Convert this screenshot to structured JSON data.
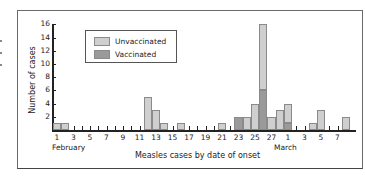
{
  "chart_data": {
    "type": "bar",
    "stacked": true,
    "title": "",
    "xlabel": "Measles cases by date of onset",
    "ylabel": "Number of cases",
    "ylim": [
      0,
      16
    ],
    "yticks": [
      2,
      4,
      6,
      8,
      10,
      12,
      14,
      16
    ],
    "grid": false,
    "legend_position": "upper-left-inside",
    "colors": {
      "Unvaccinated": "#cfcfcf",
      "Vaccinated": "#9a9a9a"
    },
    "xtick_labels": [
      "1",
      "3",
      "5",
      "7",
      "9",
      "11",
      "13",
      "15",
      "17",
      "19",
      "21",
      "23",
      "25",
      "27",
      "1",
      "3",
      "5",
      "7"
    ],
    "month_labels": [
      "February",
      "March"
    ],
    "categories": [
      "Feb 1",
      "Feb 2",
      "Feb 3",
      "Feb 4",
      "Feb 5",
      "Feb 6",
      "Feb 7",
      "Feb 8",
      "Feb 9",
      "Feb 10",
      "Feb 11",
      "Feb 12",
      "Feb 13",
      "Feb 14",
      "Feb 15",
      "Feb 16",
      "Feb 17",
      "Feb 18",
      "Feb 19",
      "Feb 20",
      "Feb 21",
      "Feb 22",
      "Feb 23",
      "Feb 24",
      "Feb 25",
      "Feb 26",
      "Feb 27",
      "Feb 28",
      "Mar 1",
      "Mar 2",
      "Mar 3",
      "Mar 4",
      "Mar 5",
      "Mar 6",
      "Mar 7",
      "Mar 8"
    ],
    "series": [
      {
        "name": "Vaccinated",
        "values": [
          0,
          0,
          0,
          0,
          0,
          0,
          0,
          0,
          0,
          0,
          0,
          0,
          0,
          0,
          0,
          0,
          0,
          0,
          0,
          0,
          0,
          0,
          2,
          0,
          0,
          6,
          0,
          0,
          1,
          0,
          0,
          0,
          0,
          0,
          0,
          0
        ]
      },
      {
        "name": "Unvaccinated",
        "values": [
          1,
          1,
          0,
          0,
          0,
          0,
          0,
          0,
          0,
          0,
          0,
          5,
          3,
          1,
          0,
          1,
          0,
          0,
          0,
          0,
          1,
          0,
          0,
          2,
          4,
          10,
          2,
          3,
          3,
          0,
          0,
          1,
          3,
          0,
          0,
          2
        ]
      }
    ]
  },
  "legend": {
    "items": [
      {
        "label": "Unvaccinated"
      },
      {
        "label": "Vaccinated"
      }
    ]
  }
}
